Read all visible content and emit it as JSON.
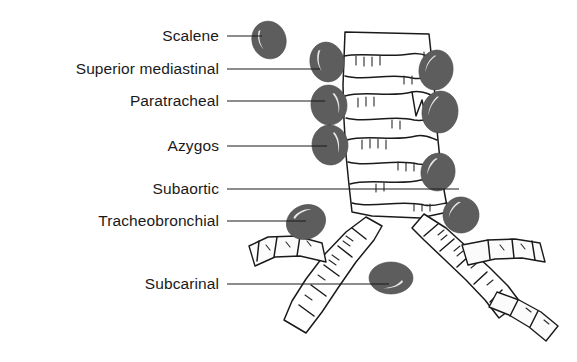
{
  "figure": {
    "background_color": "#ffffff",
    "node_color": "#5d5d5d",
    "line_color": "#1a1a1a",
    "airway_fill": "#ffffff"
  },
  "labels": [
    {
      "id": "scalene",
      "text": "Scalene",
      "text_x": 219,
      "text_y": 40,
      "line_x1": 227,
      "line_x2": 262,
      "line_y": 36
    },
    {
      "id": "superior-mediastinal",
      "text": "Superior mediastinal",
      "text_x": 219,
      "text_y": 73,
      "line_x1": 227,
      "line_x2": 320,
      "line_y": 69
    },
    {
      "id": "paratracheal",
      "text": "Paratracheal",
      "text_x": 219,
      "text_y": 105,
      "line_x1": 227,
      "line_x2": 325,
      "line_y": 101
    },
    {
      "id": "azygos",
      "text": "Azygos",
      "text_x": 219,
      "text_y": 150,
      "line_x1": 227,
      "line_x2": 327,
      "line_y": 146
    },
    {
      "id": "subaortic",
      "text": "Subaortic",
      "text_x": 219,
      "text_y": 193,
      "line_x1": 227,
      "line_x2": 459,
      "line_y": 189
    },
    {
      "id": "tracheobronchial",
      "text": "Tracheobronchial",
      "text_x": 219,
      "text_y": 225,
      "line_x1": 227,
      "line_x2": 306,
      "line_y": 221
    },
    {
      "id": "subcarinal",
      "text": "Subcarinal",
      "text_x": 219,
      "text_y": 288,
      "line_x1": 227,
      "line_x2": 389,
      "line_y": 284
    }
  ],
  "nodes": [
    {
      "id": "scalene-node",
      "cx": 269,
      "cy": 40,
      "rx": 17,
      "ry": 19,
      "rot": -18
    },
    {
      "id": "superior-mediastinal-left",
      "cx": 327,
      "cy": 62,
      "rx": 17,
      "ry": 20,
      "rot": -12
    },
    {
      "id": "superior-mediastinal-right",
      "cx": 436,
      "cy": 70,
      "rx": 17,
      "ry": 20,
      "rot": 10
    },
    {
      "id": "paratracheal-left",
      "cx": 329,
      "cy": 105,
      "rx": 18,
      "ry": 20,
      "rot": -8
    },
    {
      "id": "paratracheal-right",
      "cx": 440,
      "cy": 112,
      "rx": 18,
      "ry": 21,
      "rot": 8
    },
    {
      "id": "azygos-node",
      "cx": 330,
      "cy": 145,
      "rx": 18,
      "ry": 20,
      "rot": -6
    },
    {
      "id": "subaortic-node",
      "cx": 438,
      "cy": 172,
      "rx": 17,
      "ry": 19,
      "rot": 12
    },
    {
      "id": "tracheobronchial-left",
      "cx": 306,
      "cy": 222,
      "rx": 20,
      "ry": 17,
      "rot": -22
    },
    {
      "id": "tracheobronchial-right",
      "cx": 461,
      "cy": 215,
      "rx": 18,
      "ry": 18,
      "rot": 18
    },
    {
      "id": "subcarinal-node",
      "cx": 391,
      "cy": 278,
      "rx": 22,
      "ry": 16,
      "rot": 0
    }
  ]
}
